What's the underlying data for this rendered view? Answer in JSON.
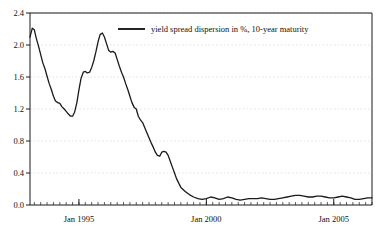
{
  "chart_data": {
    "type": "line",
    "title": "",
    "subtitle": "",
    "xlabel": "",
    "ylabel": "",
    "grid": true,
    "legend_position": "top-center",
    "xlim": [
      1993.08,
      2006.5
    ],
    "ylim": [
      0.0,
      2.4
    ],
    "ytick_labels": [
      "0.0",
      "0.4",
      "0.8",
      "1.2",
      "1.6",
      "2.0",
      "2.4"
    ],
    "ytick_values": [
      0.0,
      0.4,
      0.8,
      1.2,
      1.6,
      2.0,
      2.4
    ],
    "xtick_labels": [
      "Jan 1995",
      "Jan 2000",
      "Jan 2005"
    ],
    "xtick_values": [
      1995.0,
      2000.0,
      2005.0
    ],
    "series": [
      {
        "name": "yield spread dispersion in %, 10-year maturity",
        "color": "#1a1a1a",
        "x": [
          1993.08,
          1993.17,
          1993.25,
          1993.33,
          1993.42,
          1993.5,
          1993.58,
          1993.67,
          1993.75,
          1993.83,
          1993.92,
          1994.0,
          1994.08,
          1994.17,
          1994.25,
          1994.33,
          1994.42,
          1994.5,
          1994.58,
          1994.67,
          1994.75,
          1994.83,
          1994.92,
          1995.0,
          1995.08,
          1995.17,
          1995.25,
          1995.33,
          1995.42,
          1995.5,
          1995.58,
          1995.67,
          1995.75,
          1995.83,
          1995.92,
          1996.0,
          1996.08,
          1996.17,
          1996.25,
          1996.33,
          1996.42,
          1996.5,
          1996.58,
          1996.67,
          1996.75,
          1996.83,
          1996.92,
          1997.0,
          1997.08,
          1997.17,
          1997.25,
          1997.33,
          1997.42,
          1997.5,
          1997.58,
          1997.67,
          1997.75,
          1997.83,
          1997.92,
          1998.0,
          1998.08,
          1998.17,
          1998.25,
          1998.33,
          1998.42,
          1998.5,
          1998.58,
          1998.67,
          1998.75,
          1998.83,
          1998.92,
          1999.0,
          1999.17,
          1999.33,
          1999.5,
          1999.67,
          1999.83,
          2000.0,
          2000.17,
          2000.33,
          2000.5,
          2000.67,
          2000.83,
          2001.0,
          2001.17,
          2001.33,
          2001.5,
          2001.67,
          2001.83,
          2002.0,
          2002.17,
          2002.33,
          2002.5,
          2002.67,
          2002.83,
          2003.0,
          2003.17,
          2003.33,
          2003.5,
          2003.67,
          2003.83,
          2004.0,
          2004.17,
          2004.33,
          2004.5,
          2004.67,
          2004.83,
          2005.0,
          2005.17,
          2005.33,
          2005.5,
          2005.67,
          2005.83,
          2006.0,
          2006.17,
          2006.33,
          2006.5
        ],
        "y": [
          2.1,
          2.21,
          2.19,
          2.08,
          1.98,
          1.88,
          1.78,
          1.7,
          1.61,
          1.52,
          1.44,
          1.36,
          1.3,
          1.28,
          1.27,
          1.23,
          1.2,
          1.17,
          1.14,
          1.11,
          1.11,
          1.16,
          1.28,
          1.44,
          1.58,
          1.66,
          1.67,
          1.65,
          1.66,
          1.72,
          1.8,
          1.92,
          2.04,
          2.13,
          2.15,
          2.1,
          2.02,
          1.93,
          1.91,
          1.92,
          1.9,
          1.82,
          1.74,
          1.66,
          1.6,
          1.52,
          1.44,
          1.36,
          1.28,
          1.22,
          1.2,
          1.11,
          1.06,
          1.03,
          0.97,
          0.9,
          0.84,
          0.78,
          0.72,
          0.66,
          0.62,
          0.61,
          0.66,
          0.67,
          0.66,
          0.62,
          0.55,
          0.47,
          0.4,
          0.33,
          0.27,
          0.22,
          0.17,
          0.13,
          0.1,
          0.08,
          0.07,
          0.08,
          0.1,
          0.09,
          0.07,
          0.08,
          0.1,
          0.09,
          0.07,
          0.06,
          0.07,
          0.08,
          0.08,
          0.08,
          0.09,
          0.08,
          0.07,
          0.07,
          0.08,
          0.09,
          0.1,
          0.11,
          0.12,
          0.12,
          0.11,
          0.1,
          0.1,
          0.11,
          0.11,
          0.1,
          0.09,
          0.09,
          0.1,
          0.11,
          0.1,
          0.09,
          0.07,
          0.07,
          0.08,
          0.09,
          0.09
        ]
      }
    ],
    "legend": [
      {
        "label": "yield spread dispersion in %, 10-year maturity",
        "color": "#1a1a1a"
      }
    ]
  },
  "axes": {
    "y_ticks": [
      {
        "label": "0.0"
      },
      {
        "label": "0.4"
      },
      {
        "label": "0.8"
      },
      {
        "label": "1.2"
      },
      {
        "label": "1.6"
      },
      {
        "label": "2.0"
      },
      {
        "label": "2.4"
      }
    ],
    "x_ticks": [
      {
        "label": "Jan 1995"
      },
      {
        "label": "Jan 2000"
      },
      {
        "label": "Jan 2005"
      }
    ]
  },
  "style": {
    "axis_color": "#1a1a1a",
    "grid_color": "#cfcfcf",
    "line_color": "#1a1a1a",
    "background": "#ffffff"
  }
}
